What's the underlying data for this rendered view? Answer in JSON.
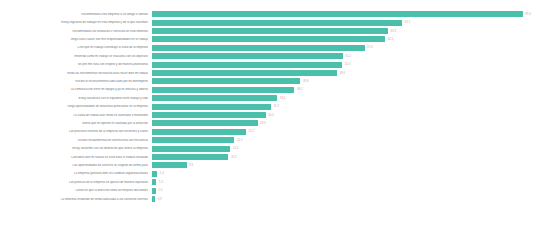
{
  "chart_data": {
    "type": "bar",
    "orientation": "horizontal",
    "title": "",
    "subtitle": "",
    "xlabel": "",
    "ylabel": "",
    "grid": false,
    "legend": false,
    "axis_visible": false,
    "background_color": "#ffffff",
    "bar_color": "#4abfac",
    "label_color": "#6e7478",
    "value_label_color": "#c9a9a9",
    "xlim": [
      0,
      100
    ],
    "sorted": "descending",
    "categories": [
      "Recomendaria esta empresa a un amigo o familiar",
      "Estoy orgulloso de trabajar en esta empresa y de lo que hacemos",
      "Recomendaria los productos y servicios de esta empresa",
      "Tengo claro cuales son mis responsabilidades en el trabajo",
      "Creo que mi trabajo contribuye al exito de la empresa",
      "Entiendo como mi trabajo se relaciona con los objetivos",
      "Mi jefe me trata con respeto y de manera profesional",
      "Tengo las herramientas necesarias para hacer bien mi trabajo",
      "Recibo el reconocimiento adecuado por mi desempeno",
      "La comunicacion entre mi equipo y yo es efectiva y abierta",
      "Estoy satisfecho con el equilibrio entre trabajo y vida",
      "Tengo oportunidades de desarrollo profesional en la empresa",
      "La carga de trabajo que tengo es razonable y manejable",
      "Siento que mi opinion es valorada por la direccion",
      "Los procesos internos de la empresa son eficientes y claros",
      "Recibo retroalimentacion constructiva con frecuencia",
      "Estoy conforme con los beneficios que ofrece la empresa",
      "Considero que mi salario es justo para el trabajo realizado",
      "Las oportunidades de ascenso se asignan de forma justa",
      "La empresa gestiona bien los cambios organizacionales",
      "Las politicas de la empresa se aplican de manera equitativa",
      "Confio en que la direccion toma las mejores decisiones",
      "La empresa responde de forma adecuada a los conflictos internos"
    ],
    "values": [
      99.4,
      67.1,
      63.3,
      62.5,
      57.0,
      51.2,
      51.0,
      49.6,
      39.8,
      38.2,
      33.6,
      31.9,
      30.5,
      28.3,
      25.2,
      22.1,
      21.0,
      20.5,
      9.3,
      1.4,
      1.2,
      1.0,
      0.9
    ],
    "value_labels": [
      "99.4",
      "67.1",
      "63.3",
      "62.5",
      "57.0",
      "51.2",
      "51.0",
      "49.6",
      "39.8",
      "38.2",
      "33.6",
      "31.9",
      "30.5",
      "28.3",
      "25.2",
      "22.1",
      "21.0",
      "20.5",
      "9.3",
      "1.4",
      "1.2",
      "1.0",
      "0.9"
    ]
  }
}
